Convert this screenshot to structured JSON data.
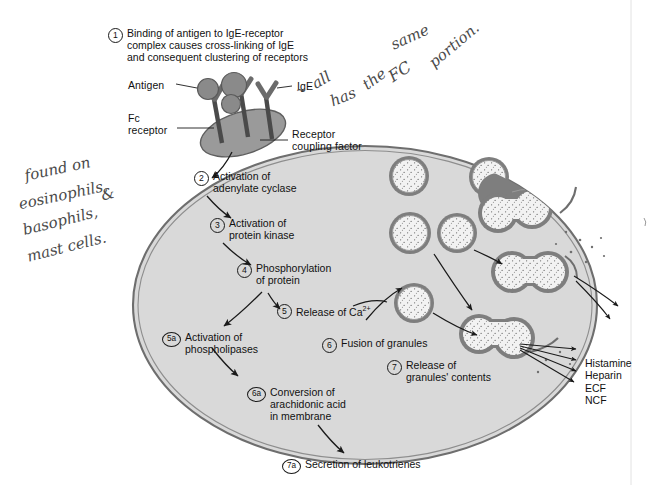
{
  "figure": {
    "cell_fill": "#d9d9d9",
    "membrane_color": "#6e6e6e",
    "granule_ring": "#7a7a7a",
    "granule_fill": "#f2f2f2",
    "receptor_fill": "#9a9a9a",
    "antigen_fill": "#8a8a8a",
    "text_color": "#111111"
  },
  "callouts": {
    "antigen": "Antigen",
    "ige": "IgE",
    "fc_receptor": "Fc\nreceptor",
    "receptor_coupling_factor": "Receptor\ncoupling factor"
  },
  "steps": [
    {
      "id": "1",
      "label": "Binding of antigen to IgE-receptor\ncomplex causes cross-linking of IgE\nand consequent clustering of receptors"
    },
    {
      "id": "2",
      "label": "Activation of\nadenylate cyclase"
    },
    {
      "id": "3",
      "label": "Activation of\nprotein kinase"
    },
    {
      "id": "4",
      "label": "Phosphorylation\nof protein"
    },
    {
      "id": "5",
      "label": "Release of Ca"
    },
    {
      "id": "5a",
      "label": "Activation of\nphospholipases"
    },
    {
      "id": "6",
      "label": "Fusion of granules"
    },
    {
      "id": "6a",
      "label": "Conversion of\narachidonic acid\nin membrane"
    },
    {
      "id": "7",
      "label": "Release of\ngranules' contents"
    },
    {
      "id": "7a",
      "label": "Secretion of leukotrienes"
    }
  ],
  "superscripts": {
    "calcium_charge": "2+"
  },
  "mediators": {
    "items": [
      "Histamine",
      "Heparin",
      "ECF",
      "NCF"
    ],
    "text": "Histamine\nHeparin\nECF\nNCF"
  },
  "handwritten_notes": [
    {
      "id": "note-fc-portion",
      "text": "all has the same FC portion."
    },
    {
      "id": "note-cell-types",
      "text": "found on eosinophils, basophils, & mast cells."
    }
  ],
  "handwriting": {
    "fc_all": "all",
    "fc_has": "has",
    "fc_the": "the",
    "fc_fc": "FC",
    "fc_same": "same",
    "fc_portion": "portion.",
    "tilde": "~",
    "cells_found": "found on",
    "cells_eos": "eosinophils,",
    "cells_baso": "basophils,",
    "cells_amp": "&",
    "cells_mast": "mast cells."
  }
}
